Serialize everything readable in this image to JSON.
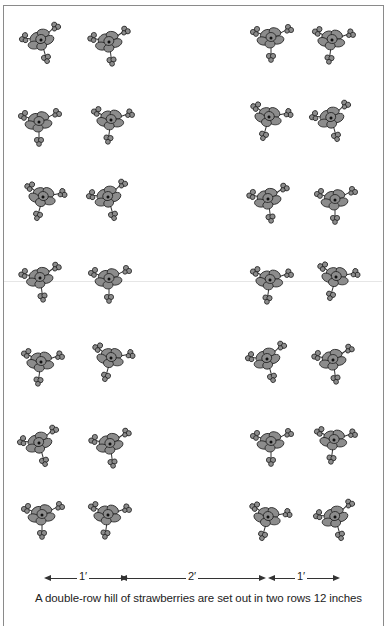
{
  "figure": {
    "rows": 7,
    "plants_per_row": 4,
    "plant_icon": "strawberry-plant-icon",
    "colors": {
      "line": "#333333",
      "leaf_fill": "#8c8c8c",
      "frame": "#8a8a8a"
    }
  },
  "measurements": [
    {
      "label": "1′"
    },
    {
      "label": "2′"
    },
    {
      "label": "1′"
    }
  ],
  "caption": "A double-row hill of strawberries are set out in two rows 12 inches"
}
